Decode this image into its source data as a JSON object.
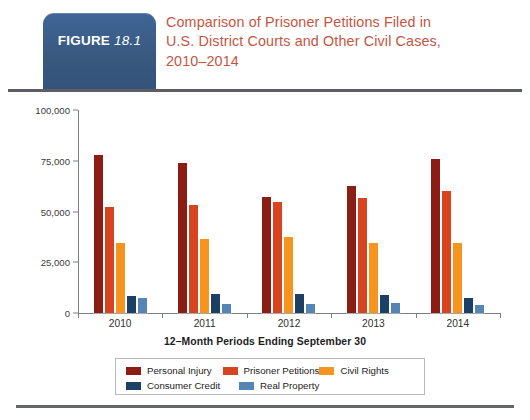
{
  "header": {
    "badge_word": "FIGURE",
    "badge_number": "18.1",
    "badge_color": "#3a5c88",
    "title_color": "#c6553f",
    "title_lines": [
      "Comparison of Prisoner Petitions Filed in",
      "U.S. District Courts and Other Civil Cases,",
      "2010–2014"
    ]
  },
  "chart_data": {
    "type": "bar",
    "title": "Comparison of Prisoner Petitions Filed in U.S. District Courts and Other Civil Cases, 2010–2014",
    "xlabel": "12–Month Periods Ending September 30",
    "ylabel": "",
    "categories": [
      "2010",
      "2011",
      "2012",
      "2013",
      "2014"
    ],
    "ylim": [
      0,
      100000
    ],
    "yticks": [
      0,
      25000,
      50000,
      75000,
      100000
    ],
    "ytick_labels": [
      "0",
      "25,000",
      "50,000",
      "75,000",
      "100,000"
    ],
    "grid": false,
    "legend_position": "bottom",
    "series": [
      {
        "name": "Personal Injury",
        "color": "#8c1d15",
        "values": [
          78000,
          74000,
          57000,
          62500,
          76000
        ]
      },
      {
        "name": "Prisoner Petitions",
        "color": "#d8441f",
        "values": [
          52000,
          53000,
          54500,
          56500,
          60000
        ]
      },
      {
        "name": "Civil Rights",
        "color": "#f7941e",
        "values": [
          34500,
          36500,
          37500,
          34500,
          34500
        ]
      },
      {
        "name": "Consumer Credit",
        "color": "#1c3f66",
        "values": [
          8500,
          9500,
          9500,
          9000,
          7500
        ]
      },
      {
        "name": "Real Property",
        "color": "#5585b5",
        "values": [
          7500,
          4500,
          4500,
          5000,
          4000
        ]
      }
    ]
  },
  "legend": {
    "row1": [
      "Personal Injury",
      "Prisoner Petitions",
      "Civil Rights"
    ],
    "row2": [
      "Consumer Credit",
      "Real Property"
    ]
  }
}
